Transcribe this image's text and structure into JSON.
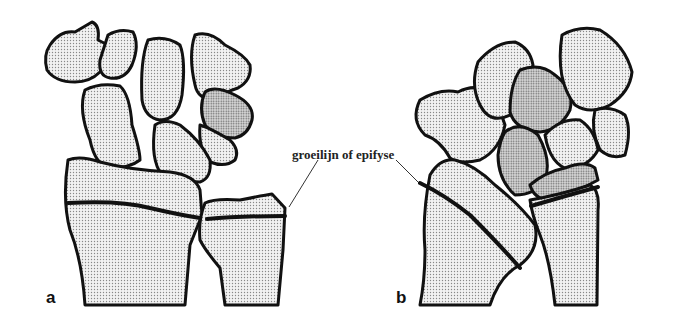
{
  "figure": {
    "annotation_label": "groeilijn of epifyse",
    "panels": [
      {
        "letter": "a",
        "description": "wrist bones with visible growth plates (front view)"
      },
      {
        "letter": "b",
        "description": "wrist bones with visible growth plate (rotated view)"
      }
    ],
    "colors": {
      "outline": "#111111",
      "stipple": "#888888",
      "background": "#ffffff"
    }
  }
}
